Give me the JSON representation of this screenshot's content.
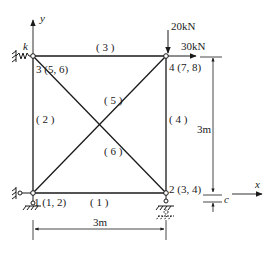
{
  "diagram": {
    "type": "truss",
    "nodes": [
      {
        "id": "1",
        "label": "1",
        "dof": "(1,  2)",
        "support": "pin"
      },
      {
        "id": "2",
        "label": "2",
        "dof": "(3,  4)",
        "support": "roller-with-settlement"
      },
      {
        "id": "3",
        "label": "3",
        "dof": "(5,  6)",
        "support": "spring"
      },
      {
        "id": "4",
        "label": "4",
        "dof": "(7,  8)",
        "support": "free"
      }
    ],
    "elements": [
      {
        "id": "1",
        "label": "( 1 )",
        "from": "1",
        "to": "2"
      },
      {
        "id": "2",
        "label": "( 2 )",
        "from": "1",
        "to": "3"
      },
      {
        "id": "3",
        "label": "( 3 )",
        "from": "3",
        "to": "4"
      },
      {
        "id": "4",
        "label": "( 4 )",
        "from": "2",
        "to": "4"
      },
      {
        "id": "5",
        "label": "( 5 )",
        "from": "2",
        "to": "3"
      },
      {
        "id": "6",
        "label": "( 6 )",
        "from": "1",
        "to": "4"
      }
    ],
    "loads": {
      "vertical": "20kN",
      "horizontal": "30kN"
    },
    "spring_label": "k",
    "settlement_label": "c",
    "axes": {
      "x": "x",
      "y": "y"
    },
    "dimensions": {
      "width": "3m",
      "height": "3m"
    }
  }
}
